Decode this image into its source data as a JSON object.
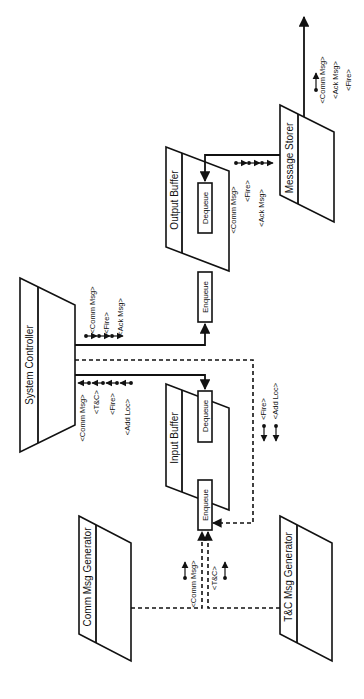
{
  "diagram": {
    "title": "",
    "orientation": "rotated-90-ccw",
    "blocks": {
      "system_controller": "System Controller",
      "output_buffer": "Output Buffer",
      "input_buffer": "Input Buffer",
      "message_storer": "Message Storer",
      "comm_msg_generator": "Comm Msg Generator",
      "tc_msg_generator": "T&C Msg Generator"
    },
    "queues": {
      "output_dequeue": "Dequeue",
      "output_enqueue": "Enqueue",
      "input_dequeue": "Dequeue",
      "input_enqueue": "Enqueue"
    },
    "messages": {
      "controller_to_output": [
        "<Comm Msg>",
        "<Fire>",
        "<Ack Msg>"
      ],
      "controller_from_input": [
        "<Comm Msg>",
        "<T&C>",
        "<Fire>",
        "<Add Loc>"
      ],
      "output_to_storer": [
        "<Comm Msg>",
        "<Fire>",
        "<Ack Msg>"
      ],
      "storer_output": [
        "<Comm Msg>",
        "<Ack Msg>",
        "<Fire>"
      ],
      "controller_to_input_dashed": [
        "<Fire>",
        "<Add Loc>"
      ],
      "comm_gen_to_input": "<Comm Msg>",
      "tc_gen_to_input": "<T&C>"
    },
    "colors": {
      "stroke": "#111111",
      "background": "#ffffff"
    }
  }
}
